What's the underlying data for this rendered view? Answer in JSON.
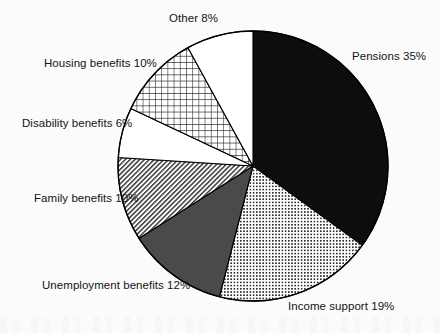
{
  "chart_data": {
    "type": "pie",
    "title": "",
    "subtitle": "",
    "xlabel": "",
    "ylabel": "",
    "legend_position": "none",
    "grid": false,
    "label_format": "{name} {value}%",
    "start_angle_deg": 0,
    "direction": "clockwise",
    "categories": [
      "Pensions",
      "Income support",
      "Unemployment benefits",
      "Family benefits",
      "Disability benefits",
      "Housing benefits",
      "Other"
    ],
    "values": [
      35,
      19,
      12,
      10,
      6,
      10,
      8
    ],
    "total": 100,
    "units": "percent",
    "slices": [
      {
        "name": "Pensions",
        "value": 35,
        "label": "Pensions 35%",
        "fill_style": "solid-black",
        "fill_color": "#0d0d0d",
        "outline_color": "#000000",
        "start_angle_deg": 0,
        "end_angle_deg": 126
      },
      {
        "name": "Income support",
        "value": 19,
        "label": "Income support 19%",
        "fill_style": "fine-dot-grid",
        "fill_color": "#ffffff",
        "pattern_color": "#2b2b2b",
        "outline_color": "#000000",
        "start_angle_deg": 126,
        "end_angle_deg": 194.4
      },
      {
        "name": "Unemployment benefits",
        "value": 12,
        "label": "Unemployment benefits 12%",
        "fill_style": "solid-dark-gray",
        "fill_color": "#4a4a4a",
        "outline_color": "#000000",
        "start_angle_deg": 194.4,
        "end_angle_deg": 237.6
      },
      {
        "name": "Family benefits",
        "value": 10,
        "label": "Family benefits 10%",
        "fill_style": "diagonal-hatch",
        "fill_color": "#ffffff",
        "pattern_color": "#3a3a3a",
        "outline_color": "#000000",
        "start_angle_deg": 237.6,
        "end_angle_deg": 273.6
      },
      {
        "name": "Disability benefits",
        "value": 6,
        "label": "Disability benefits 6%",
        "fill_style": "white",
        "fill_color": "#ffffff",
        "outline_color": "#000000",
        "start_angle_deg": 273.6,
        "end_angle_deg": 295.2
      },
      {
        "name": "Housing benefits",
        "value": 10,
        "label": "Housing benefits 10%",
        "fill_style": "cross-hatch-grid",
        "fill_color": "#ffffff",
        "pattern_color": "#262626",
        "outline_color": "#000000",
        "start_angle_deg": 295.2,
        "end_angle_deg": 331.2
      },
      {
        "name": "Other",
        "value": 8,
        "label": "Other 8%",
        "fill_style": "white",
        "fill_color": "#ffffff",
        "outline_color": "#000000",
        "start_angle_deg": 331.2,
        "end_angle_deg": 360
      }
    ],
    "geometry": {
      "center_x": 253,
      "center_y": 166,
      "radius": 135
    },
    "colors": {
      "background": "#fbfbfb",
      "text": "#141414",
      "outline": "#000000"
    }
  }
}
